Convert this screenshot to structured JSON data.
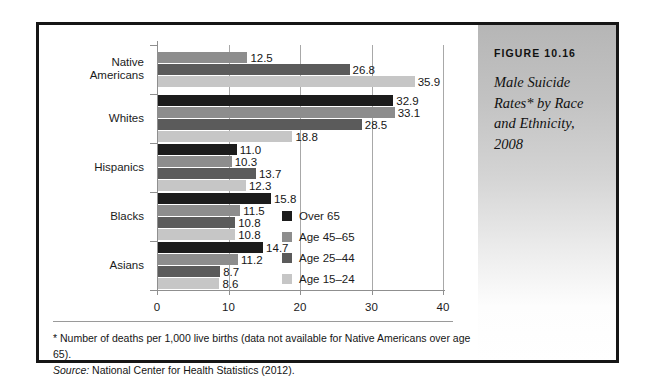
{
  "figure": {
    "number_label": "FIGURE 10.16",
    "caption": "Male Suicide Rates* by Race and Ethnicity, 2008"
  },
  "footnote": {
    "asterisk_note": "* Number of deaths per 1,000 live births (data not available for Native Americans over age 65).",
    "source_label": "Source:",
    "source_text": " National Center for Health Statistics (2012)."
  },
  "chart_data": {
    "type": "bar",
    "orientation": "horizontal",
    "title": "Male Suicide Rates* by Race and Ethnicity, 2008",
    "xlabel": "",
    "ylabel": "",
    "xlim": [
      0,
      40
    ],
    "xticks": [
      "0",
      "10",
      "20",
      "30",
      "40"
    ],
    "grid": "vertical",
    "legend_position": "inside-right",
    "categories": [
      "Native Americans",
      "Whites",
      "Hispanics",
      "Blacks",
      "Asians"
    ],
    "series": [
      {
        "name": "Over 65",
        "color": "#1c1c1c",
        "values": [
          null,
          32.9,
          11.0,
          15.8,
          14.7
        ],
        "labels": [
          "",
          "32.9",
          "11.0",
          "15.8",
          "14.7"
        ]
      },
      {
        "name": "Age 45–65",
        "color": "#8d8d8d",
        "values": [
          12.5,
          33.1,
          10.3,
          11.5,
          11.2
        ],
        "labels": [
          "12.5",
          "33.1",
          "10.3",
          "11.5",
          "11.2"
        ]
      },
      {
        "name": "Age 25–44",
        "color": "#5b5b5b",
        "values": [
          26.8,
          28.5,
          13.7,
          10.8,
          8.7
        ],
        "labels": [
          "26.8",
          "28.5",
          "13.7",
          "10.8",
          "8.7"
        ]
      },
      {
        "name": "Age 15–24",
        "color": "#c6c6c6",
        "values": [
          35.9,
          18.8,
          12.3,
          10.8,
          8.6
        ],
        "labels": [
          "35.9",
          "18.8",
          "12.3",
          "10.8",
          "8.6"
        ]
      }
    ]
  }
}
